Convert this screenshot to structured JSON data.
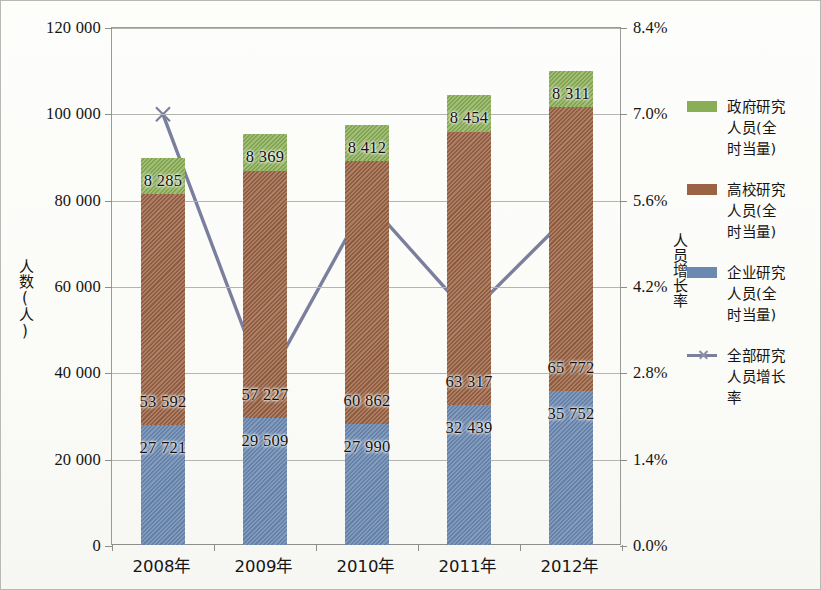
{
  "chart_data": {
    "type": "bar",
    "subtype": "stacked-column-with-secondary-axis-line",
    "title": "",
    "xlabel": "",
    "ylabel": "人数(人)",
    "y2label": "人员增长率",
    "categories": [
      "2008年",
      "2009年",
      "2010年",
      "2011年",
      "2012年"
    ],
    "ylim": [
      0,
      120000
    ],
    "yticks": [
      0,
      20000,
      40000,
      60000,
      80000,
      100000,
      120000
    ],
    "ytick_labels": [
      "0",
      "20 000",
      "40 000",
      "60 000",
      "80 000",
      "100 000",
      "120 000"
    ],
    "y2lim": [
      0,
      8.4
    ],
    "y2ticks": [
      0.0,
      1.4,
      2.8,
      4.2,
      5.6,
      7.0,
      8.4
    ],
    "y2tick_labels": [
      "0.0%",
      "1.4%",
      "2.8%",
      "4.2%",
      "5.6%",
      "7.0%",
      "8.4%"
    ],
    "grid": true,
    "legend_position": "right",
    "series": [
      {
        "name": "企业研究人员(全时当量)",
        "type": "bar",
        "color": "#6a88b0",
        "axis": "left",
        "values": [
          27721,
          29509,
          27990,
          32439,
          35752
        ],
        "labels": [
          "27 721",
          "29 509",
          "27 990",
          "32 439",
          "35 752"
        ]
      },
      {
        "name": "高校研究人员(全时当量)",
        "type": "bar",
        "color": "#9a6344",
        "axis": "left",
        "values": [
          53592,
          57227,
          60862,
          63317,
          65772
        ],
        "labels": [
          "53 592",
          "57 227",
          "60 862",
          "63 317",
          "65 772"
        ]
      },
      {
        "name": "政府研究人员(全时当量)",
        "type": "bar",
        "color": "#8aae56",
        "axis": "left",
        "values": [
          8285,
          8369,
          8412,
          8454,
          8311
        ],
        "labels": [
          "8 285",
          "8 369",
          "8 412",
          "8 454",
          "8 311"
        ]
      },
      {
        "name": "全部研究人员增长率",
        "type": "line",
        "color": "#7b7f9e",
        "marker": "x",
        "axis": "right",
        "values": [
          7.0,
          2.6,
          5.6,
          3.75,
          5.4
        ]
      }
    ],
    "legend": [
      {
        "label_lines": [
          "政府研究",
          "人员(全",
          "时当量)"
        ],
        "swatch": "#8aae56",
        "kind": "swatch"
      },
      {
        "label_lines": [
          "高校研究",
          "人员(全",
          "时当量)"
        ],
        "swatch": "#9a6344",
        "kind": "swatch"
      },
      {
        "label_lines": [
          "企业研究",
          "人员(全",
          "时当量)"
        ],
        "swatch": "#6a88b0",
        "kind": "swatch"
      },
      {
        "label_lines": [
          "全部研究",
          "人员增长",
          "率"
        ],
        "swatch": "#7b7f9e",
        "kind": "line-marker"
      }
    ]
  }
}
